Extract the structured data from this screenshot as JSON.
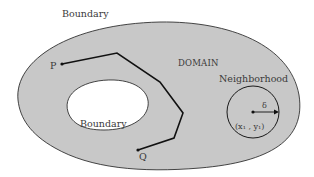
{
  "diagram": {
    "type": "domain-connectivity-figure",
    "labels": {
      "outer_boundary": "Boundary",
      "inner_boundary": "Boundary",
      "domain": "DOMAIN",
      "neighborhood": "Neighborhood",
      "point_p": "P",
      "point_q": "Q",
      "radius": "δ",
      "center": "(x₁ , y₁)"
    },
    "colors": {
      "domain_fill": "#c8c8c8",
      "hole_fill": "#ffffff",
      "stroke": "#1a1a1a",
      "text": "#3a3a3a",
      "background": "#ffffff"
    }
  }
}
